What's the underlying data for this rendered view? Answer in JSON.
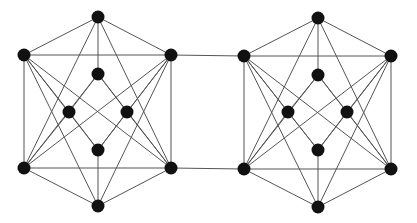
{
  "diagram": {
    "type": "graph",
    "style": {
      "node_color": "#111111",
      "edge_color": "#555555",
      "node_radius": 6.5,
      "background": "#ffffff"
    },
    "graphs": [
      {
        "id": "left",
        "nodes": {
          "top": [
            98,
            17
          ],
          "ul": [
            24,
            55
          ],
          "ur": [
            171,
            55
          ],
          "it": [
            98,
            74
          ],
          "il": [
            69,
            112
          ],
          "ir": [
            127,
            112
          ],
          "ib": [
            98,
            150
          ],
          "ll": [
            24,
            168
          ],
          "lr": [
            171,
            168
          ],
          "bot": [
            98,
            206
          ]
        }
      },
      {
        "id": "right",
        "nodes": {
          "top": [
            318,
            18
          ],
          "ul": [
            244,
            56
          ],
          "ur": [
            391,
            56
          ],
          "it": [
            318,
            75
          ],
          "il": [
            288,
            112
          ],
          "ir": [
            347,
            112
          ],
          "ib": [
            318,
            150
          ],
          "ll": [
            244,
            169
          ],
          "lr": [
            391,
            169
          ],
          "bot": [
            318,
            207
          ]
        }
      }
    ],
    "edges_per_graph": [
      [
        "top",
        "ul"
      ],
      [
        "top",
        "ur"
      ],
      [
        "top",
        "it"
      ],
      [
        "top",
        "ll"
      ],
      [
        "top",
        "lr"
      ],
      [
        "ul",
        "ur"
      ],
      [
        "ul",
        "ll"
      ],
      [
        "ur",
        "lr"
      ],
      [
        "ll",
        "lr"
      ],
      [
        "ul",
        "lr"
      ],
      [
        "ur",
        "ll"
      ],
      [
        "ul",
        "bot"
      ],
      [
        "ur",
        "bot"
      ],
      [
        "ll",
        "bot"
      ],
      [
        "lr",
        "bot"
      ],
      [
        "ul",
        "il"
      ],
      [
        "ll",
        "il"
      ],
      [
        "ur",
        "ir"
      ],
      [
        "lr",
        "ir"
      ],
      [
        "ul",
        "ib"
      ],
      [
        "ur",
        "ib"
      ],
      [
        "ll",
        "it"
      ],
      [
        "lr",
        "it"
      ],
      [
        "it",
        "il"
      ],
      [
        "it",
        "ir"
      ],
      [
        "ib",
        "il"
      ],
      [
        "ib",
        "ir"
      ],
      [
        "ib",
        "bot"
      ]
    ],
    "bridge_edges": [
      [
        [
          171,
          55
        ],
        [
          244,
          56
        ]
      ],
      [
        [
          171,
          168
        ],
        [
          244,
          169
        ]
      ]
    ]
  }
}
